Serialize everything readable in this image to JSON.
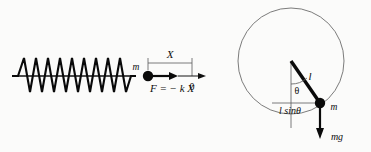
{
  "figure": {
    "background_color": "#fbfbfa",
    "ink_color": "#0d0d0d"
  },
  "spring_diagram": {
    "name": "mass-spring-oscillator",
    "mass_label": "m",
    "displacement_label": "X",
    "force_label": "F = − k X",
    "origin_label": "0",
    "spring_coil_count": 9,
    "baseline_y": 76,
    "spring_start_x": 12,
    "spring_end_x": 131,
    "mass_x": 148,
    "origin_x": 192,
    "arrow_tip_x": 205
  },
  "pendulum_diagram": {
    "name": "simple-pendulum",
    "length_label": "l",
    "angle_label": "θ",
    "horizontal_component_label": "l sinθ",
    "mass_label": "m",
    "weight_label": "mg",
    "circle_center_x": 291,
    "circle_center_y": 61,
    "circle_radius": 53,
    "pivot_x": 291,
    "pivot_y": 61,
    "bob_x": 320,
    "bob_y": 103,
    "weight_arrow_tip_y": 139
  }
}
